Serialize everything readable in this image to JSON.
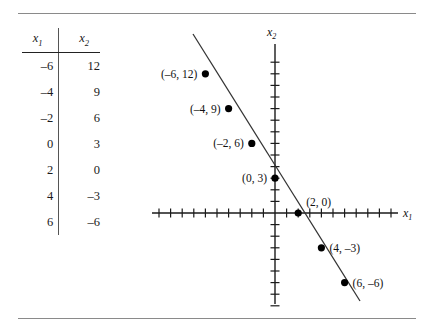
{
  "figure": {
    "rules": {
      "top": "horizontal-rule",
      "bottom": "horizontal-rule"
    }
  },
  "table": {
    "headers": [
      {
        "base": "x",
        "sub": "1"
      },
      {
        "base": "x",
        "sub": "2"
      }
    ],
    "rows": [
      {
        "x1": "–6",
        "x2": "12"
      },
      {
        "x1": "–4",
        "x2": "9"
      },
      {
        "x1": "–2",
        "x2": "6"
      },
      {
        "x1": "0",
        "x2": "3"
      },
      {
        "x1": "2",
        "x2": "0"
      },
      {
        "x1": "4",
        "x2": "–3"
      },
      {
        "x1": "6",
        "x2": "–6"
      }
    ]
  },
  "graph": {
    "x_axis_label": {
      "base": "x",
      "sub": "1"
    },
    "y_axis_label": {
      "base": "x",
      "sub": "2"
    },
    "point_labels": [
      "(–6, 12)",
      "(–4, 9)",
      "(–2, 6)",
      "(0, 3)",
      "(2, 0)",
      "(4, –3)",
      "(6, –6)"
    ]
  },
  "chart_data": {
    "type": "line",
    "title": "",
    "xlabel": "x1",
    "ylabel": "x2",
    "xlim": [
      -10,
      10
    ],
    "ylim": [
      -9,
      14
    ],
    "grid": false,
    "legend": "none",
    "equation": "3x1 + 2x2 = 6",
    "x": [
      -6,
      -4,
      -2,
      0,
      2,
      4,
      6
    ],
    "values": [
      12,
      9,
      6,
      3,
      0,
      -3,
      -6
    ],
    "series": [
      {
        "name": "x2 = 3 - 1.5 x1",
        "points": [
          {
            "x": -6,
            "y": 12,
            "label": "(–6, 12)"
          },
          {
            "x": -4,
            "y": 9,
            "label": "(–4, 9)"
          },
          {
            "x": -2,
            "y": 6,
            "label": "(–2, 6)"
          },
          {
            "x": 0,
            "y": 3,
            "label": "(0, 3)"
          },
          {
            "x": 2,
            "y": 0,
            "label": "(2, 0)"
          },
          {
            "x": 4,
            "y": -3,
            "label": "(4, –3)"
          },
          {
            "x": 6,
            "y": -6,
            "label": "(6, –6)"
          }
        ]
      }
    ],
    "x_ticks": [
      -10,
      -9,
      -8,
      -7,
      -6,
      -5,
      -4,
      -3,
      -2,
      -1,
      0,
      1,
      2,
      3,
      4,
      5,
      6,
      7,
      8,
      9,
      10
    ],
    "y_ticks": [
      -8,
      -7,
      -6,
      -5,
      -4,
      -3,
      -2,
      -1,
      0,
      1,
      2,
      3,
      4,
      5,
      6,
      7,
      8,
      9,
      10,
      11,
      12,
      13
    ]
  }
}
